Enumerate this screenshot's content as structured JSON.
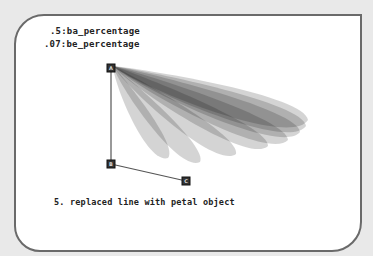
{
  "parameters": [
    {
      "text": ".5:ba_percentage"
    },
    {
      "text": ".07:be_percentage"
    }
  ],
  "caption": "5. replaced line with petal object",
  "points": [
    {
      "label": "A"
    },
    {
      "label": "B"
    },
    {
      "label": "C"
    }
  ],
  "petals": {
    "count": 8,
    "color": "#000000"
  }
}
